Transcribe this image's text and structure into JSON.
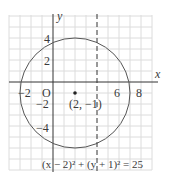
{
  "figure": {
    "axis_labels": {
      "x": "x",
      "y": "y"
    },
    "origin_label": "O",
    "x_ticks": [
      {
        "value": -2,
        "label": "−2"
      },
      {
        "value": 6,
        "label": "6"
      },
      {
        "value": 8,
        "label": "8"
      }
    ],
    "y_ticks": [
      {
        "value": 4,
        "label": "4"
      },
      {
        "value": 2,
        "label": "2"
      },
      {
        "value": -2,
        "label": "−2"
      },
      {
        "value": -4,
        "label": "−4"
      }
    ],
    "center": {
      "x": 2,
      "y": -1,
      "label": "(2, −1)"
    },
    "radius": 5,
    "dashed_line": {
      "x": 4
    },
    "equation": "(x − 2)² + (y + 1)² = 25",
    "colors": {
      "grid": "#d8d8d8",
      "axis": "#333333",
      "circle": "#555555",
      "text": "#3a3a3a"
    }
  }
}
